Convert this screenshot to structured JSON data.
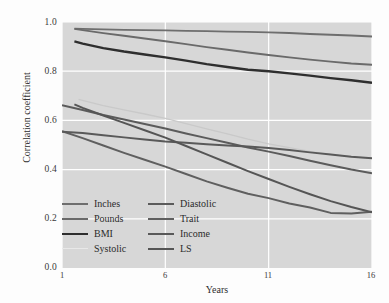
{
  "chart_data": {
    "type": "line",
    "title": "",
    "xlabel": "Years",
    "ylabel": "Correlation coefficient",
    "xlim": [
      1,
      16
    ],
    "ylim": [
      0.0,
      1.0
    ],
    "xticks": [
      "1",
      "6",
      "11",
      "16"
    ],
    "xtick_values": [
      1,
      6,
      11,
      16
    ],
    "yticks": [
      "0.0",
      "0.2",
      "0.4",
      "0.6",
      "0.8",
      "1.0"
    ],
    "ytick_values": [
      0.0,
      0.2,
      0.4,
      0.6,
      0.8,
      1.0
    ],
    "grid": "white gridlines on gray panel, both axes",
    "legend_position": "lower-left inside plot, two columns",
    "panel_background": "#d7d7d7",
    "figure_background": "#fdfdfd",
    "x": [
      1,
      2,
      3,
      4,
      5,
      6,
      7,
      8,
      9,
      10,
      11,
      12,
      13,
      14,
      15,
      16
    ],
    "series": [
      {
        "name": "Inches",
        "color": "#6e6e6e",
        "width": 1.9,
        "x": [
          1.6,
          2,
          3,
          4,
          5,
          6,
          7,
          8,
          9,
          10,
          11,
          12,
          13,
          14,
          15,
          16
        ],
        "values": [
          0.973,
          0.972,
          0.97,
          0.968,
          0.967,
          0.966,
          0.964,
          0.963,
          0.961,
          0.96,
          0.958,
          0.955,
          0.951,
          0.948,
          0.945,
          0.941
        ]
      },
      {
        "name": "Pounds",
        "color": "#6a6a6a",
        "width": 1.9,
        "x": [
          1.6,
          2,
          3,
          4,
          5,
          6,
          7,
          8,
          9,
          10,
          11,
          12,
          13,
          14,
          15,
          16
        ],
        "values": [
          0.972,
          0.967,
          0.955,
          0.944,
          0.933,
          0.922,
          0.91,
          0.898,
          0.887,
          0.876,
          0.866,
          0.856,
          0.847,
          0.839,
          0.831,
          0.826
        ]
      },
      {
        "name": "BMI",
        "color": "#2e2e2e",
        "width": 2.4,
        "x": [
          1.6,
          2,
          3,
          4,
          5,
          6,
          7,
          8,
          9,
          10,
          11,
          12,
          13,
          14,
          15,
          16
        ],
        "values": [
          0.921,
          0.912,
          0.894,
          0.88,
          0.868,
          0.856,
          0.843,
          0.829,
          0.817,
          0.806,
          0.8,
          0.791,
          0.782,
          0.772,
          0.763,
          0.753
        ]
      },
      {
        "name": "Systolic",
        "color": "#c9c9c9",
        "width": 1.3,
        "x": [
          1.8,
          3,
          4,
          5,
          6,
          7,
          8,
          9,
          10,
          11,
          12,
          13,
          14,
          15,
          16
        ],
        "values": [
          0.685,
          0.66,
          0.643,
          0.626,
          0.608,
          0.587,
          0.566,
          0.545,
          0.524,
          0.505,
          0.489,
          0.474,
          0.462,
          0.452,
          0.446
        ]
      },
      {
        "name": "Diastolic",
        "color": "#5b5b5b",
        "width": 2.0,
        "x": [
          1,
          2,
          3,
          4,
          5,
          6,
          7,
          8,
          9,
          10,
          11,
          12,
          13,
          14,
          15,
          16
        ],
        "values": [
          0.662,
          0.642,
          0.622,
          0.604,
          0.585,
          0.567,
          0.547,
          0.528,
          0.509,
          0.49,
          0.473,
          0.455,
          0.436,
          0.418,
          0.4,
          0.385
        ]
      },
      {
        "name": "Trait",
        "color": "#5f5f5f",
        "width": 2.0,
        "x": [
          1,
          2,
          3,
          4,
          5,
          6,
          7,
          8,
          9,
          10,
          11,
          12,
          13,
          14,
          15,
          16
        ],
        "values": [
          0.556,
          0.528,
          0.498,
          0.468,
          0.44,
          0.412,
          0.382,
          0.352,
          0.326,
          0.302,
          0.284,
          0.262,
          0.246,
          0.224,
          0.222,
          0.229
        ]
      },
      {
        "name": "Income",
        "color": "#595959",
        "width": 2.0,
        "x": [
          1,
          2,
          3,
          4,
          5,
          6,
          7,
          8,
          9,
          10,
          11,
          12,
          13,
          14,
          15,
          16
        ],
        "values": [
          0.554,
          0.549,
          0.54,
          0.531,
          0.522,
          0.514,
          0.509,
          0.503,
          0.498,
          0.494,
          0.488,
          0.48,
          0.47,
          0.461,
          0.452,
          0.446
        ]
      },
      {
        "name": "LS",
        "color": "#555555",
        "width": 2.0,
        "x": [
          1.6,
          2,
          3,
          4,
          5,
          6,
          7,
          8,
          9,
          10,
          11,
          12,
          13,
          14,
          15,
          16
        ],
        "values": [
          0.665,
          0.651,
          0.62,
          0.59,
          0.56,
          0.53,
          0.496,
          0.462,
          0.428,
          0.394,
          0.362,
          0.33,
          0.3,
          0.272,
          0.248,
          0.226
        ]
      }
    ]
  },
  "axes": {
    "ylabel": "Correlation coefficient",
    "xlabel": "Years",
    "yticks": [
      "1.0",
      "0.8",
      "0.6",
      "0.4",
      "0.2",
      "0.0"
    ],
    "xticks": [
      "1",
      "6",
      "11",
      "16"
    ]
  },
  "legend": {
    "column1": [
      {
        "label": "Inches",
        "color": "#6e6e6e",
        "width": 2.2,
        "has_swatch": true
      },
      {
        "label": "Pounds",
        "color": "#6a6a6a",
        "width": 2.2,
        "has_swatch": true
      },
      {
        "label": "BMI",
        "color": "#2e2e2e",
        "width": 2.8,
        "has_swatch": true
      },
      {
        "label": "Systolic",
        "color": "#e6e6e6",
        "width": 1.6,
        "has_swatch": true
      }
    ],
    "column2": [
      {
        "label": "Diastolic",
        "color": "#5b5b5b",
        "width": 2.4,
        "has_swatch": true
      },
      {
        "label": "Trait",
        "color": "#5f5f5f",
        "width": 2.2,
        "has_swatch": true
      },
      {
        "label": "Income",
        "color": "#595959",
        "width": 2.2,
        "has_swatch": true
      },
      {
        "label": "LS",
        "color": "#555555",
        "width": 2.4,
        "has_swatch": true
      }
    ]
  }
}
